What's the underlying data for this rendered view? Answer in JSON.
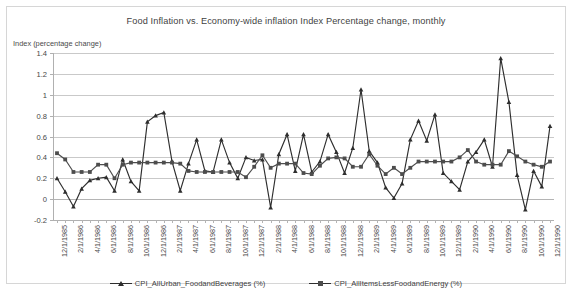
{
  "chart_data": {
    "type": "line",
    "title": "Food Inflation vs. Economy-wide inflation Index Percentage change, monthly",
    "ylabel": "Index (percentage change)",
    "xlabel": "",
    "ylim": [
      -0.2,
      1.4
    ],
    "ytick_labels": [
      "1.4",
      "1.2",
      "1",
      "0.8",
      "0.6",
      "0.4",
      "0.2",
      "0",
      "-0.2"
    ],
    "ytick_values": [
      1.4,
      1.2,
      1.0,
      0.8,
      0.6,
      0.4,
      0.2,
      0.0,
      -0.2
    ],
    "grid": true,
    "legend_position": "bottom",
    "x_tick_labels": [
      "12/1/1985",
      "2/1/1986",
      "4/1/1986",
      "6/1/1986",
      "8/1/1986",
      "10/1/1986",
      "12/1/1986",
      "2/1/1987",
      "4/1/1987",
      "6/1/1987",
      "8/1/1987",
      "10/1/1987",
      "12/1/1987",
      "2/1/1988",
      "4/1/1988",
      "6/1/1988",
      "8/1/1988",
      "10/1/1988",
      "12/1/1988",
      "2/1/1989",
      "4/1/1989",
      "6/1/1989",
      "8/1/1989",
      "10/1/1989",
      "12/1/1989",
      "2/1/1990",
      "4/1/1990",
      "6/1/1990",
      "8/1/1990",
      "10/1/1990",
      "12/1/1990"
    ],
    "x": [
      "12/1/1985",
      "1/1/1986",
      "2/1/1986",
      "3/1/1986",
      "4/1/1986",
      "5/1/1986",
      "6/1/1986",
      "7/1/1986",
      "8/1/1986",
      "9/1/1986",
      "10/1/1986",
      "11/1/1986",
      "12/1/1986",
      "1/1/1987",
      "2/1/1987",
      "3/1/1987",
      "4/1/1987",
      "5/1/1987",
      "6/1/1987",
      "7/1/1987",
      "8/1/1987",
      "9/1/1987",
      "10/1/1987",
      "11/1/1987",
      "12/1/1987",
      "1/1/1988",
      "2/1/1988",
      "3/1/1988",
      "4/1/1988",
      "5/1/1988",
      "6/1/1988",
      "7/1/1988",
      "8/1/1988",
      "9/1/1988",
      "10/1/1988",
      "11/1/1988",
      "12/1/1988",
      "1/1/1989",
      "2/1/1989",
      "3/1/1989",
      "4/1/1989",
      "5/1/1989",
      "6/1/1989",
      "7/1/1989",
      "8/1/1989",
      "9/1/1989",
      "10/1/1989",
      "11/1/1989",
      "12/1/1989",
      "1/1/1990",
      "2/1/1990",
      "3/1/1990",
      "4/1/1990",
      "5/1/1990",
      "6/1/1990",
      "7/1/1990",
      "8/1/1990",
      "9/1/1990",
      "10/1/1990",
      "11/1/1990",
      "12/1/1990"
    ],
    "series": [
      {
        "name": "CPI_AllUrban_FoodandBeverages (%)",
        "marker": "triangle",
        "color": "#2e2e2e",
        "values": [
          0.2,
          0.07,
          -0.07,
          0.1,
          0.18,
          0.2,
          0.21,
          0.08,
          0.38,
          0.17,
          0.08,
          0.74,
          0.8,
          0.83,
          0.36,
          0.08,
          0.34,
          0.57,
          0.27,
          0.26,
          0.57,
          0.35,
          0.2,
          0.4,
          0.37,
          0.38,
          -0.08,
          0.43,
          0.62,
          0.27,
          0.62,
          0.26,
          0.36,
          0.62,
          0.45,
          0.25,
          0.49,
          1.05,
          0.46,
          0.35,
          0.11,
          0.01,
          0.15,
          0.57,
          0.75,
          0.56,
          0.81,
          0.25,
          0.17,
          0.09,
          0.36,
          0.45,
          0.57,
          0.31,
          1.35,
          0.93,
          0.23,
          -0.1,
          0.27,
          0.12,
          0.7
        ]
      },
      {
        "name": "CPI_AllItemsLessFoodandEnergy (%)",
        "marker": "square",
        "color": "#4d4d4d",
        "values": [
          0.44,
          0.38,
          0.26,
          0.26,
          0.26,
          0.33,
          0.33,
          0.2,
          0.33,
          0.35,
          0.35,
          0.35,
          0.35,
          0.35,
          0.35,
          0.34,
          0.27,
          0.26,
          0.26,
          0.26,
          0.26,
          0.26,
          0.26,
          0.21,
          0.31,
          0.42,
          0.3,
          0.34,
          0.34,
          0.34,
          0.25,
          0.24,
          0.32,
          0.39,
          0.4,
          0.39,
          0.31,
          0.31,
          0.43,
          0.32,
          0.24,
          0.3,
          0.24,
          0.3,
          0.36,
          0.36,
          0.36,
          0.36,
          0.36,
          0.4,
          0.47,
          0.36,
          0.33,
          0.33,
          0.33,
          0.46,
          0.41,
          0.36,
          0.33,
          0.31,
          0.36
        ]
      }
    ]
  },
  "legend": {
    "entries": [
      {
        "label": "CPI_AllUrban_FoodandBeverages (%)"
      },
      {
        "label": "CPI_AllItemsLessFoodandEnergy (%)"
      }
    ]
  }
}
